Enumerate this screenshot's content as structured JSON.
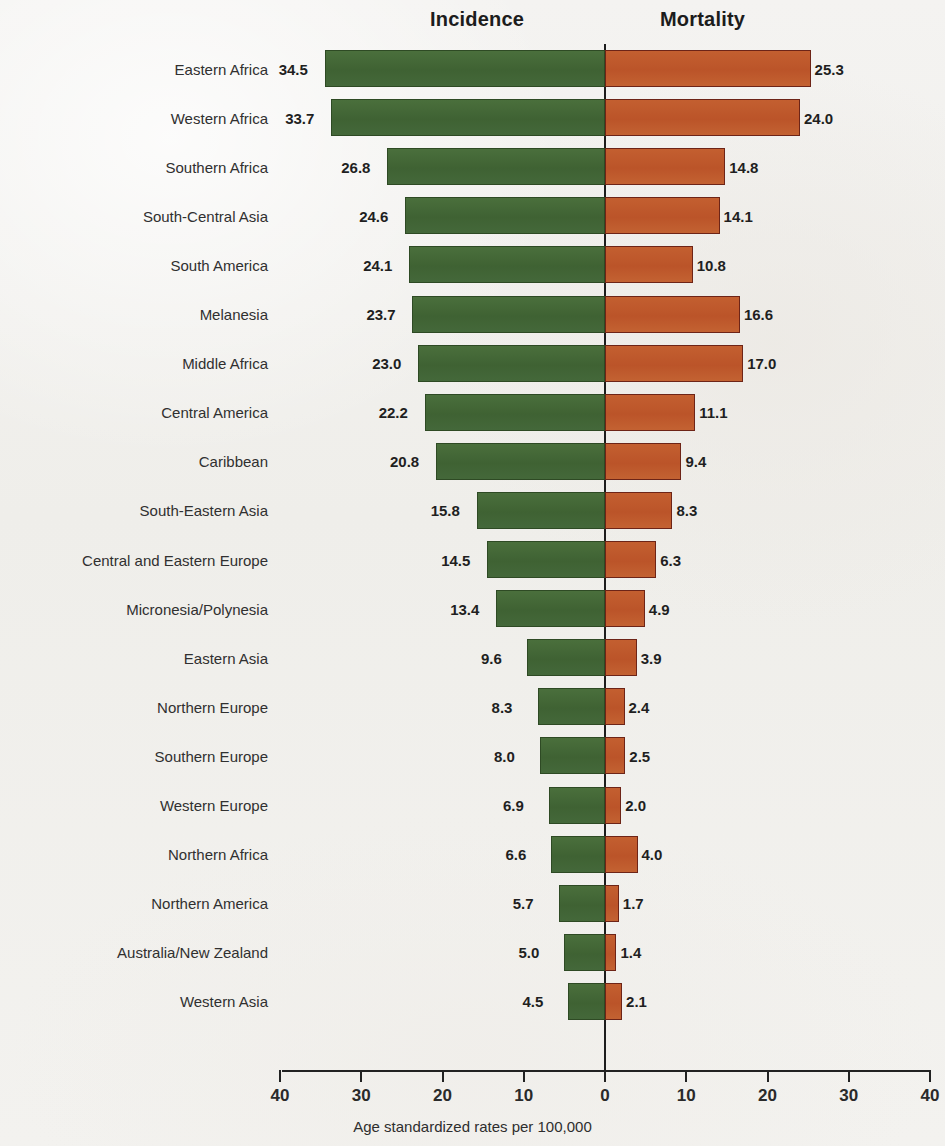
{
  "headers": {
    "incidence": "Incidence",
    "mortality": "Mortality"
  },
  "axis": {
    "caption": "Age standardized rates per 100,000",
    "ticks": [
      "40",
      "30",
      "20",
      "10",
      "0",
      "10",
      "20",
      "30",
      "40"
    ]
  },
  "colors": {
    "incidence_fill": "#3f6233",
    "incidence_border": "#2e4a24",
    "mortality_fill": "#bb5429",
    "mortality_border": "#6d2417",
    "background": "#f2f1ef",
    "axis": "#222222"
  },
  "chart_data": {
    "type": "bar",
    "orientation": "horizontal",
    "style": "diverging-pyramid",
    "title": "",
    "xlabel": "Age standardized rates per 100,000",
    "ylabel": "",
    "xlim": [
      -40,
      40
    ],
    "xticks": [
      -40,
      -30,
      -20,
      -10,
      0,
      10,
      20,
      30,
      40
    ],
    "xtick_labels": [
      "40",
      "30",
      "20",
      "10",
      "0",
      "10",
      "20",
      "30",
      "40"
    ],
    "grid": false,
    "legend": [
      "Incidence",
      "Mortality"
    ],
    "legend_position": "top",
    "categories": [
      "Eastern Africa",
      "Western Africa",
      "Southern Africa",
      "South-Central Asia",
      "South America",
      "Melanesia",
      "Middle Africa",
      "Central America",
      "Caribbean",
      "South-Eastern Asia",
      "Central and Eastern Europe",
      "Micronesia/Polynesia",
      "Eastern Asia",
      "Northern Europe",
      "Southern Europe",
      "Western Europe",
      "Northern Africa",
      "Northern America",
      "Australia/New Zealand",
      "Western Asia"
    ],
    "series": [
      {
        "name": "Incidence",
        "side": "left",
        "values": [
          34.5,
          33.7,
          26.8,
          24.6,
          24.1,
          23.7,
          23.0,
          22.2,
          20.8,
          15.8,
          14.5,
          13.4,
          9.6,
          8.3,
          8.0,
          6.9,
          6.6,
          5.7,
          5.0,
          4.5
        ],
        "labels": [
          "34.5",
          "33.7",
          "26.8",
          "24.6",
          "24.1",
          "23.7",
          "23.0",
          "22.2",
          "20.8",
          "15.8",
          "14.5",
          "13.4",
          "9.6",
          "8.3",
          "8.0",
          "6.9",
          "6.6",
          "5.7",
          "5.0",
          "4.5"
        ]
      },
      {
        "name": "Mortality",
        "side": "right",
        "values": [
          25.3,
          24.0,
          14.8,
          14.1,
          10.8,
          16.6,
          17.0,
          11.1,
          9.4,
          8.3,
          6.3,
          4.9,
          3.9,
          2.4,
          2.5,
          2.0,
          4.0,
          1.7,
          1.4,
          2.1
        ],
        "labels": [
          "25.3",
          "24.0",
          "14.8",
          "14.1",
          "10.8",
          "16.6",
          "17.0",
          "11.1",
          "9.4",
          "8.3",
          "6.3",
          "4.9",
          "3.9",
          "2.4",
          "2.5",
          "2.0",
          "4.0",
          "1.7",
          "1.4",
          "2.1"
        ]
      }
    ]
  }
}
